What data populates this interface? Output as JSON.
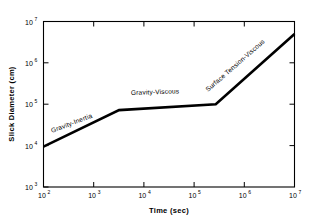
{
  "chart_data": {
    "type": "line",
    "title": "",
    "xlabel": "Time (sec)",
    "ylabel": "Slick Diameter (cm)",
    "xscale": "log",
    "yscale": "log",
    "xlim": [
      100,
      10000000
    ],
    "ylim": [
      1000,
      10000000
    ],
    "grid": false,
    "legend": null,
    "xticks": [
      {
        "value": 100,
        "label": "10",
        "exponent": "2"
      },
      {
        "value": 1000,
        "label": "10",
        "exponent": "3"
      },
      {
        "value": 10000,
        "label": "10",
        "exponent": "4"
      },
      {
        "value": 100000,
        "label": "10",
        "exponent": "5"
      },
      {
        "value": 1000000,
        "label": "10",
        "exponent": "6"
      },
      {
        "value": 10000000,
        "label": "10",
        "exponent": "7"
      }
    ],
    "yticks": [
      {
        "value": 1000,
        "label": "10",
        "exponent": "3"
      },
      {
        "value": 10000,
        "label": "10",
        "exponent": "4"
      },
      {
        "value": 100000,
        "label": "10",
        "exponent": "5"
      },
      {
        "value": 1000000,
        "label": "10",
        "exponent": "6"
      },
      {
        "value": 10000000,
        "label": "10",
        "exponent": "7"
      }
    ],
    "series": [
      {
        "name": "Slick spreading regimes",
        "color": "#000000",
        "x": [
          100,
          3200,
          270000,
          10000000
        ],
        "y": [
          9500,
          72000,
          100000,
          5000000
        ]
      }
    ],
    "annotations": [
      {
        "text": "Gravity-Inertia",
        "x": 700,
        "y": 20000,
        "rotation": -21
      },
      {
        "text": "Gravity-Viscous",
        "x": 25000,
        "y": 155000,
        "rotation": -2
      },
      {
        "text": "Surface Tension-Viscous",
        "x": 1100000,
        "y": 900000,
        "rotation": -41
      }
    ]
  }
}
